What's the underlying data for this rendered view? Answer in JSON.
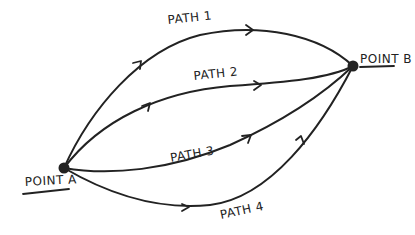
{
  "diagram": {
    "title": "",
    "colors": {
      "ink": "#222222",
      "background": "#ffffff"
    },
    "nodes": [
      {
        "id": "A",
        "label": "POINT A"
      },
      {
        "id": "B",
        "label": "POINT B"
      }
    ],
    "paths": [
      {
        "id": "path-1",
        "label": "PATH 1",
        "from": "A",
        "to": "B"
      },
      {
        "id": "path-2",
        "label": "PATH 2",
        "from": "A",
        "to": "B"
      },
      {
        "id": "path-3",
        "label": "PATH 3",
        "from": "A",
        "to": "B"
      },
      {
        "id": "path-4",
        "label": "PATH 4",
        "from": "A",
        "to": "B"
      }
    ]
  }
}
